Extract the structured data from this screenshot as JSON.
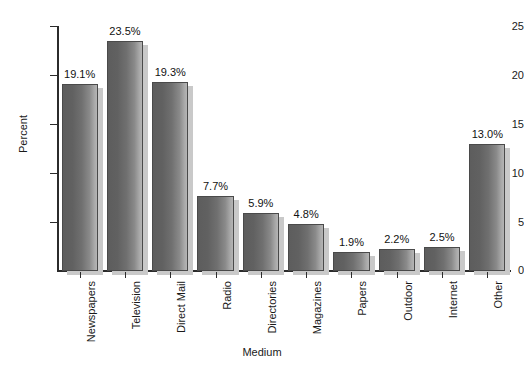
{
  "chart_data": {
    "type": "bar",
    "title": "",
    "xlabel": "Medium",
    "ylabel": "Percent",
    "ylim": [
      0,
      25
    ],
    "yticks": [
      0,
      5,
      10,
      15,
      20,
      25
    ],
    "grid": false,
    "legend": "none",
    "categories": [
      "Newspapers",
      "Television",
      "Direct Mail",
      "Radio",
      "Directories",
      "Magazines",
      "Papers",
      "Outdoor",
      "Internet",
      "Other"
    ],
    "values": [
      19.1,
      23.5,
      19.3,
      7.7,
      5.9,
      4.8,
      1.9,
      2.2,
      2.5,
      13.0
    ],
    "data_labels": [
      "19.1%",
      "23.5%",
      "19.3%",
      "7.7%",
      "5.9%",
      "4.8%",
      "1.9%",
      "2.2%",
      "2.5%",
      "13.0%"
    ],
    "colors": {
      "bar_dark": "#5d5d5d",
      "bar_light": "#b5b5b5",
      "bar_outline": "#4a4a4a",
      "bar_shadow": "#c9c9c9",
      "axis": "#2b2b2b",
      "text": "#1a1a1a",
      "background": "#ffffff"
    }
  }
}
